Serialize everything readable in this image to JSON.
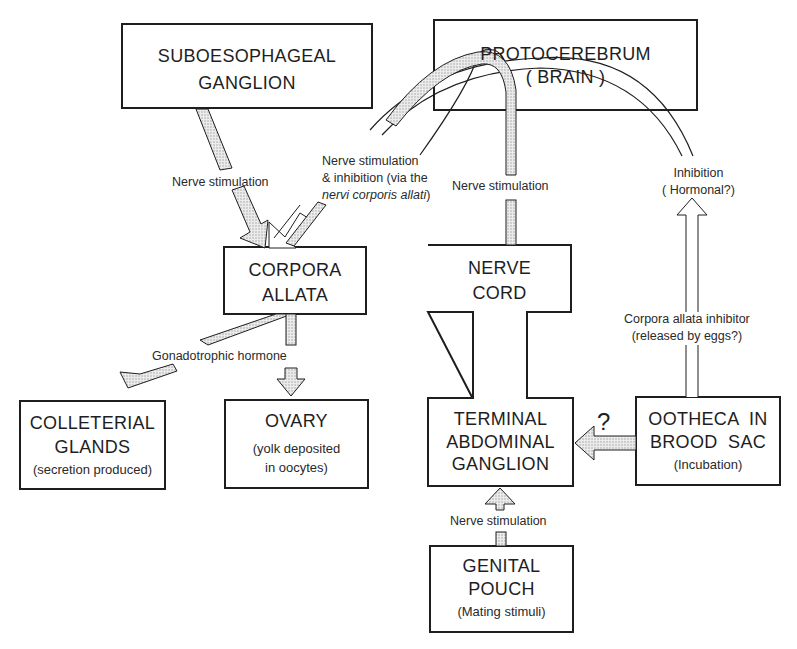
{
  "nodes": {
    "suboesophageal": {
      "title": [
        "SUBOESOPHAGEAL",
        "GANGLION"
      ]
    },
    "protocerebrum": {
      "title": [
        "PROTOCEREBRUM",
        "( BRAIN )"
      ]
    },
    "corpora_allata": {
      "title": [
        "CORPORA",
        "ALLATA"
      ]
    },
    "nerve_cord": {
      "title": [
        "NERVE",
        "CORD"
      ]
    },
    "colleterial": {
      "title": [
        "COLLETERIAL",
        "GLANDS"
      ],
      "note": "(secretion produced)"
    },
    "ovary": {
      "title": [
        "OVARY"
      ],
      "note": [
        "(yolk deposited",
        "in oocytes)"
      ]
    },
    "terminal": {
      "title": [
        "TERMINAL",
        "ABDOMINAL",
        "GANGLION"
      ]
    },
    "ootheca": {
      "title": [
        "OOTHECA  IN",
        "BROOD  SAC"
      ],
      "note": "(Incubation)"
    },
    "genital": {
      "title": [
        "GENITAL",
        "POUCH"
      ],
      "note": "(Mating stimuli)"
    }
  },
  "edges": {
    "sub_to_ca": "Nerve stimulation",
    "brain_to_ca": {
      "line1": "Nerve stimulation",
      "line2": "& inhibition (via the",
      "line3": "nervi corporis allati",
      "line3_end": ")"
    },
    "brain_to_cord": "Nerve stimulation",
    "ca_to_targets": "Gonadotrophic hormone",
    "inhibition": {
      "line1": "Inhibition",
      "line2": "( Hormonal?)"
    },
    "ca_inhibitor": {
      "line1": "Corpora allata inhibitor",
      "line2": "(released by eggs?)"
    },
    "ootheca_to_terminal": "?",
    "genital_to_terminal": "Nerve stimulation"
  },
  "colors": {
    "ink": "#1e1e1e",
    "stipple": "#d8d8d8",
    "paper": "#ffffff"
  }
}
